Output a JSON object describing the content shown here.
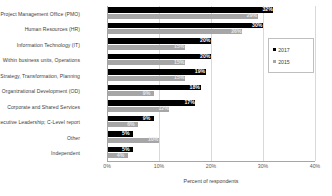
{
  "chart_data": {
    "type": "bar",
    "orientation": "horizontal",
    "title": "",
    "xlabel": "Percent of respondents",
    "ylabel": "",
    "xlim": [
      0,
      40
    ],
    "xticks": [
      "0%",
      "10%",
      "20%",
      "30%",
      "40%"
    ],
    "xtick_values": [
      0,
      10,
      20,
      30,
      40
    ],
    "grid": true,
    "legend_position": "top-right",
    "categories": [
      "Project Management Office (PMO)",
      "Human Resources (HR)",
      "Information Technology (IT)",
      "Within business units, Operations",
      "Strategy, Transformation, Planning",
      "Organizational Development (OD)",
      "Corporate and Shared Services",
      "Executive Leadership; C-Level report",
      "Other",
      "Independent"
    ],
    "series": [
      {
        "name": "2017",
        "color": "#000000",
        "values": [
          32,
          30,
          20,
          20,
          19,
          18,
          17,
          9,
          5,
          5
        ],
        "labels": [
          "32%",
          "30%",
          "20%",
          "20%",
          "19%",
          "18%",
          "17%",
          "9%",
          "5%",
          "5%"
        ]
      },
      {
        "name": "2015",
        "color": "#a6a6a6",
        "values": [
          29,
          26,
          15,
          15,
          15,
          9,
          12,
          6,
          10,
          4
        ],
        "labels": [
          "29%",
          "26%",
          "15%",
          "15%",
          "15%",
          "9%",
          "12%",
          "6%",
          "10%",
          "4%"
        ]
      }
    ]
  },
  "legend": {
    "items": [
      {
        "label": "2017",
        "color": "#000000"
      },
      {
        "label": "2015",
        "color": "#a6a6a6"
      }
    ]
  }
}
